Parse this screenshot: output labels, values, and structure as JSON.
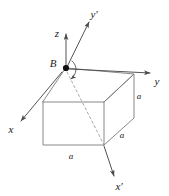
{
  "figure": {
    "type": "3d-geometry-diagram",
    "background_color": "#ffffff",
    "line_color": "#6b6b6b",
    "axis_color": "#4a4a4a",
    "text_color": "#1a1a1a",
    "point": {
      "name": "B",
      "label": "B",
      "marker": "filled-dot"
    },
    "axes": [
      {
        "id": "z",
        "label": "z",
        "direction": "up"
      },
      {
        "id": "y",
        "label": "y",
        "direction": "right"
      },
      {
        "id": "x",
        "label": "x",
        "direction": "down-left"
      },
      {
        "id": "y-prime",
        "label": "y'",
        "direction": "up-right"
      },
      {
        "id": "x-prime",
        "label": "x'",
        "direction": "down-right"
      }
    ],
    "dimension_labels": [
      {
        "id": "edge-right-vertical",
        "label": "a"
      },
      {
        "id": "edge-right-depth",
        "label": "a"
      },
      {
        "id": "edge-front-bottom",
        "label": "a"
      }
    ],
    "rotation_arc": {
      "present": true,
      "about": "vertical-axis-at-B"
    },
    "hidden_edge_style": "dashed"
  }
}
